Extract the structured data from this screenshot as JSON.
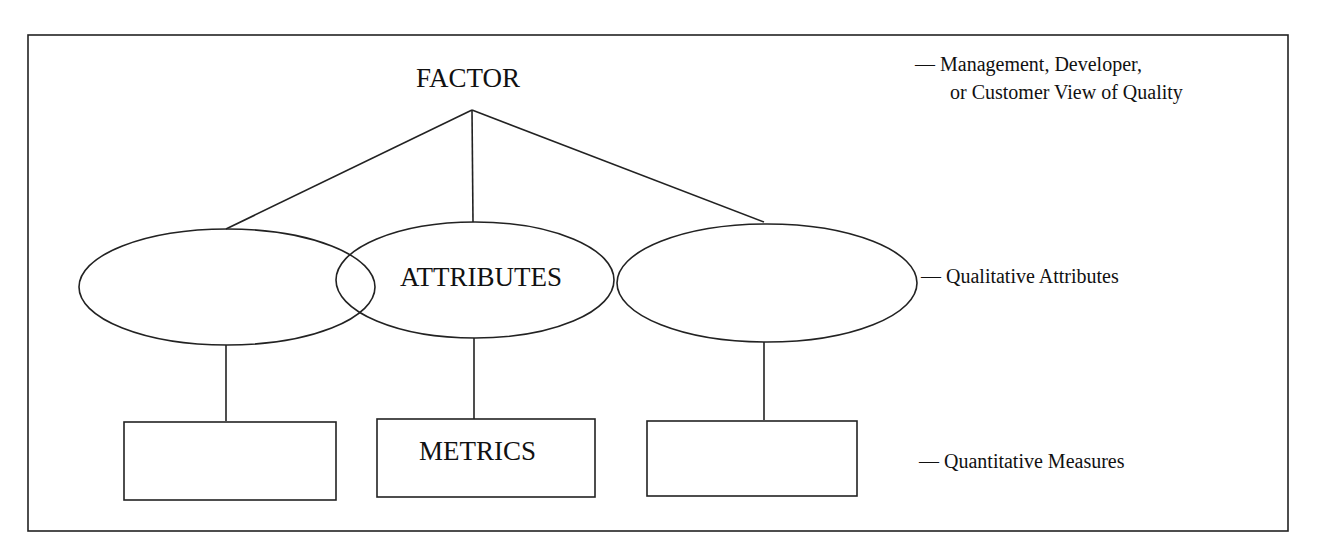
{
  "diagram": {
    "top": {
      "label": "FACTOR"
    },
    "middle": [
      {
        "label": ""
      },
      {
        "label": "ATTRIBUTES"
      },
      {
        "label": ""
      }
    ],
    "bottom": [
      {
        "label": ""
      },
      {
        "label": "METRICS"
      },
      {
        "label": ""
      }
    ],
    "annotations": {
      "factor_line1": "— Management, Developer,",
      "factor_line2": "or Customer View of Quality",
      "attributes": "— Qualitative Attributes",
      "metrics": "— Quantitative Measures"
    },
    "colors": {
      "stroke": "#222222",
      "background": "#ffffff"
    }
  }
}
